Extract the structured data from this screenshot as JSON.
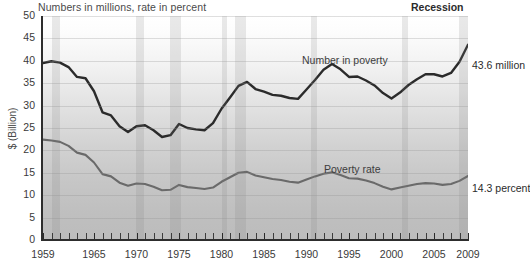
{
  "chart_data": {
    "type": "line",
    "title": "Numbers in millions, rate in percent",
    "xlabel": "",
    "ylabel": "$ (Billion)",
    "ylim": [
      0,
      50
    ],
    "xlim": [
      1959,
      2009
    ],
    "grid": true,
    "legend_position": "top-right",
    "legend": [
      "Recession"
    ],
    "y_ticks": [
      0,
      5,
      10,
      15,
      20,
      25,
      30,
      35,
      40,
      45,
      50
    ],
    "x_ticks": [
      1959,
      1965,
      1970,
      1975,
      1980,
      1985,
      1990,
      1995,
      2000,
      2005,
      2009
    ],
    "x_tick_labels": [
      "1959",
      "1965",
      "1970",
      "1975",
      "1980",
      "1985",
      "1990",
      "1995",
      "2000",
      "2005",
      "2009"
    ],
    "x_minor_tick_step": 1,
    "annotations": [
      {
        "name": "number-in-poverty-label",
        "text": "Number in poverty"
      },
      {
        "name": "poverty-rate-label",
        "text": "Poverty rate"
      },
      {
        "name": "number-in-poverty-end-value",
        "text": "43.6 million"
      },
      {
        "name": "poverty-rate-end-value",
        "text": "14.3 percent"
      }
    ],
    "x": [
      1959,
      1960,
      1961,
      1962,
      1963,
      1964,
      1965,
      1966,
      1967,
      1968,
      1969,
      1970,
      1971,
      1972,
      1973,
      1974,
      1975,
      1976,
      1977,
      1978,
      1979,
      1980,
      1981,
      1982,
      1983,
      1984,
      1985,
      1986,
      1987,
      1988,
      1989,
      1990,
      1991,
      1992,
      1993,
      1994,
      1995,
      1996,
      1997,
      1998,
      1999,
      2000,
      2001,
      2002,
      2003,
      2004,
      2005,
      2006,
      2007,
      2008,
      2009
    ],
    "series": [
      {
        "name": "Number in poverty",
        "unit": "millions",
        "color": "#2b2b2b",
        "end_value": 43.6,
        "end_label": "43.6 million",
        "values": [
          39.5,
          39.9,
          39.6,
          38.6,
          36.4,
          36.1,
          33.2,
          28.5,
          27.8,
          25.4,
          24.1,
          25.4,
          25.6,
          24.5,
          23.0,
          23.4,
          25.9,
          25.0,
          24.7,
          24.5,
          26.1,
          29.3,
          31.8,
          34.4,
          35.3,
          33.7,
          33.1,
          32.4,
          32.2,
          31.7,
          31.5,
          33.6,
          35.7,
          38.0,
          39.3,
          38.1,
          36.4,
          36.5,
          35.6,
          34.5,
          32.8,
          31.6,
          32.9,
          34.6,
          35.9,
          37.0,
          37.0,
          36.5,
          37.3,
          39.8,
          43.6
        ]
      },
      {
        "name": "Poverty rate",
        "unit": "percent",
        "color": "#6a6a6a",
        "end_value": 14.3,
        "end_label": "14.3 percent",
        "values": [
          22.4,
          22.2,
          21.9,
          21.0,
          19.5,
          19.0,
          17.3,
          14.7,
          14.2,
          12.8,
          12.1,
          12.6,
          12.5,
          11.9,
          11.1,
          11.2,
          12.3,
          11.8,
          11.6,
          11.4,
          11.7,
          13.0,
          14.0,
          15.0,
          15.2,
          14.4,
          14.0,
          13.6,
          13.4,
          13.0,
          12.8,
          13.5,
          14.2,
          14.8,
          15.1,
          14.5,
          13.8,
          13.7,
          13.3,
          12.7,
          11.9,
          11.3,
          11.7,
          12.1,
          12.5,
          12.7,
          12.6,
          12.3,
          12.5,
          13.2,
          14.3
        ]
      }
    ],
    "recession_bands": [
      {
        "start": 1960,
        "end": 1961
      },
      {
        "start": 1969.9,
        "end": 1970.9
      },
      {
        "start": 1973.9,
        "end": 1975.2
      },
      {
        "start": 1980,
        "end": 1980.6
      },
      {
        "start": 1981.6,
        "end": 1982.9
      },
      {
        "start": 1990.5,
        "end": 1991.2
      },
      {
        "start": 2001.2,
        "end": 2001.9
      },
      {
        "start": 2007.9,
        "end": 2009.4
      }
    ]
  }
}
